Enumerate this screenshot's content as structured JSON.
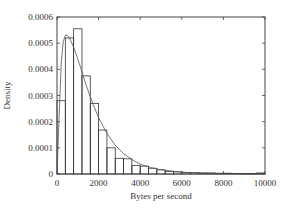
{
  "chart_data": {
    "type": "bar",
    "subtype": "histogram-with-density-curve",
    "title": "",
    "xlabel": "Bytes per second",
    "ylabel": "Density",
    "xlim": [
      0,
      10000
    ],
    "ylim": [
      0,
      0.0006
    ],
    "x_ticks": [
      0,
      2000,
      4000,
      6000,
      8000,
      10000
    ],
    "x_tick_labels": [
      "0",
      "2000",
      "4000",
      "6000",
      "8000",
      "10000"
    ],
    "y_ticks": [
      0,
      0.0001,
      0.0002,
      0.0003,
      0.0004,
      0.0005,
      0.0006
    ],
    "y_tick_labels": [
      "0",
      "0.0001",
      "0.0002",
      "0.0003",
      "0.0004",
      "0.0005",
      "0.0006"
    ],
    "grid": false,
    "legend": null,
    "bin_width": 400,
    "bins": [
      {
        "start": 0,
        "end": 400,
        "density": 0.00028
      },
      {
        "start": 400,
        "end": 800,
        "density": 0.00052
      },
      {
        "start": 800,
        "end": 1200,
        "density": 0.000555
      },
      {
        "start": 1200,
        "end": 1600,
        "density": 0.000375
      },
      {
        "start": 1600,
        "end": 2000,
        "density": 0.00027
      },
      {
        "start": 2000,
        "end": 2400,
        "density": 0.000168
      },
      {
        "start": 2400,
        "end": 2800,
        "density": 0.0001
      },
      {
        "start": 2800,
        "end": 3200,
        "density": 6e-05
      },
      {
        "start": 3200,
        "end": 3600,
        "density": 5.8e-05
      },
      {
        "start": 3600,
        "end": 4000,
        "density": 3.2e-05
      },
      {
        "start": 4000,
        "end": 4400,
        "density": 3e-05
      },
      {
        "start": 4400,
        "end": 4800,
        "density": 2.2e-05
      },
      {
        "start": 4800,
        "end": 5200,
        "density": 1.6e-05
      },
      {
        "start": 5200,
        "end": 5600,
        "density": 1e-05
      },
      {
        "start": 5600,
        "end": 6000,
        "density": 8e-06
      },
      {
        "start": 6000,
        "end": 6400,
        "density": 6e-06
      },
      {
        "start": 6400,
        "end": 6800,
        "density": 5e-06
      },
      {
        "start": 6800,
        "end": 7200,
        "density": 4e-06
      },
      {
        "start": 7200,
        "end": 7600,
        "density": 4e-06
      },
      {
        "start": 7600,
        "end": 8000,
        "density": 3e-06
      },
      {
        "start": 8000,
        "end": 8400,
        "density": 3e-06
      },
      {
        "start": 8400,
        "end": 8800,
        "density": 2e-06
      },
      {
        "start": 8800,
        "end": 9200,
        "density": 2e-06
      },
      {
        "start": 9200,
        "end": 9600,
        "density": 2e-06
      },
      {
        "start": 9600,
        "end": 10000,
        "density": 4e-06
      }
    ],
    "series": [
      {
        "name": "fitted density curve",
        "style": "thin solid line",
        "x": [
          0,
          100,
          200,
          300,
          400,
          500,
          600,
          800,
          1000,
          1200,
          1400,
          1600,
          1800,
          2000,
          2400,
          2800,
          3200,
          3600,
          4000,
          4500,
          5000,
          6000,
          7000,
          8000,
          9000,
          10000
        ],
        "y": [
          0.0,
          0.00022,
          0.00042,
          0.000505,
          0.00053,
          0.00053,
          0.00052,
          0.000485,
          0.00044,
          0.00039,
          0.00034,
          0.000295,
          0.000255,
          0.000215,
          0.000155,
          0.00011,
          7.8e-05,
          5.5e-05,
          3.8e-05,
          2.5e-05,
          1.6e-05,
          7e-06,
          3e-06,
          1.5e-06,
          7e-07,
          3e-07
        ]
      }
    ]
  },
  "plot_area": {
    "left": 57,
    "top": 17,
    "right": 265,
    "bottom": 174
  },
  "colors": {
    "frame": "#444444",
    "bars": "#333333",
    "curve": "#555555",
    "background": "#ffffff"
  }
}
